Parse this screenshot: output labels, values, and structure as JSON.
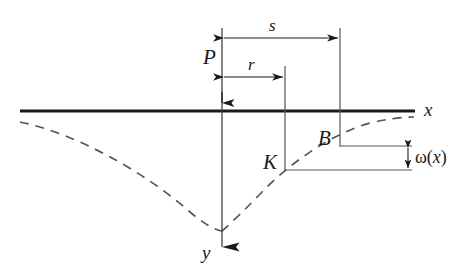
{
  "figure": {
    "background_color": "#ffffff",
    "line_color": "#1a1a1a",
    "dash_color": "#555555",
    "width": 474,
    "height": 278
  },
  "labels": {
    "load": "P",
    "distance_s": "s",
    "distance_r": "r",
    "axis_x": "x",
    "axis_y": "y",
    "point_b": "B",
    "point_k": "K",
    "deflection_omega": "ω(",
    "deflection_var": "x",
    "deflection_close": ")"
  },
  "geometry": {
    "origin_x": 222,
    "axis_y": 111,
    "x_axis_start": 20,
    "x_axis_end": 415,
    "y_axis_end": 265,
    "r_end_x": 285,
    "s_end_x": 340,
    "s_dim_y": 38,
    "r_dim_y": 77,
    "k_point_y": 170,
    "b_point_y": 146,
    "omega_arrow_x": 408,
    "curve_left_x": 20,
    "curve_left_y": 122,
    "curve_cusp_y": 230,
    "curve_right_end_x": 414,
    "curve_right_end_y": 120
  },
  "elements": {
    "x_axis": "x-axis-thick-line",
    "y_axis": "y-axis-arrow-line",
    "deflection_curve": "dashed-deflection-curve",
    "s_dimension": "double-arrow-dimension-s",
    "r_dimension": "double-arrow-dimension-r",
    "omega_dimension": "double-arrow-dimension-omega"
  }
}
